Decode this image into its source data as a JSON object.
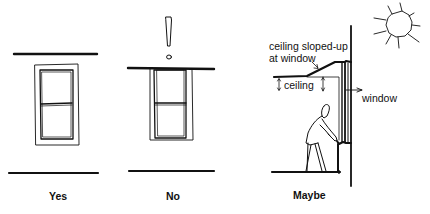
{
  "figure": {
    "panels": [
      {
        "id": "yes",
        "caption": "Yes"
      },
      {
        "id": "no",
        "caption": "No",
        "mark": "!"
      },
      {
        "id": "maybe",
        "caption": "Maybe"
      }
    ],
    "annotations": {
      "sloped_line1": "ceiling sloped-up",
      "sloped_line2": "at window",
      "ceiling": "ceiling",
      "window": "window"
    },
    "colors": {
      "ink": "#111111",
      "background": "#ffffff"
    }
  }
}
